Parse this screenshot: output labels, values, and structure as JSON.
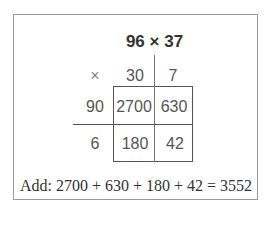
{
  "title": "96 × 37",
  "header": {
    "symbol": "×",
    "col1": "30",
    "col2": "7"
  },
  "rows": [
    {
      "label": "90",
      "c1": "2700",
      "c2": "630"
    },
    {
      "label": "6",
      "c1": "180",
      "c2": "42"
    }
  ],
  "summary": "Add: 2700 + 630 + 180 + 42 = 3552"
}
